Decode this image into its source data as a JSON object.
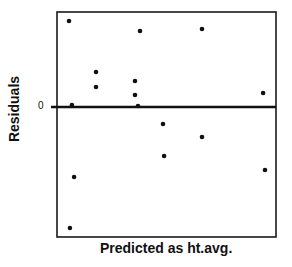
{
  "chart_data": {
    "type": "scatter",
    "title": "",
    "xlabel": "Predicted as ht.avg.",
    "ylabel": "Residuals",
    "y_tick_labels": [
      "0"
    ],
    "x_tick_labels": [],
    "xlim": [
      0,
      100
    ],
    "ylim": [
      -13,
      9.5
    ],
    "grid": false,
    "legend": null,
    "reference_line": {
      "y": 0,
      "style": "solid",
      "weight": "bold"
    },
    "points": [
      {
        "x": 5.5,
        "y": 8.6
      },
      {
        "x": 6.8,
        "y": 0.2
      },
      {
        "x": 7.8,
        "y": -7.0
      },
      {
        "x": 5.9,
        "y": -12.1
      },
      {
        "x": 17.8,
        "y": 3.5
      },
      {
        "x": 17.8,
        "y": 2.0
      },
      {
        "x": 37.9,
        "y": 7.6
      },
      {
        "x": 35.6,
        "y": 2.6
      },
      {
        "x": 35.6,
        "y": 1.2
      },
      {
        "x": 37.0,
        "y": 0.1
      },
      {
        "x": 48.4,
        "y": -1.7
      },
      {
        "x": 48.9,
        "y": -4.9
      },
      {
        "x": 66.2,
        "y": 7.8
      },
      {
        "x": 66.2,
        "y": -3.0
      },
      {
        "x": 94.1,
        "y": 1.4
      },
      {
        "x": 95.0,
        "y": -6.3
      }
    ]
  },
  "colors": {
    "frame": "#1a1a1a",
    "points": "#111111",
    "zero_line": "#111111",
    "background": "#ffffff"
  },
  "frame_px": {
    "left": 57,
    "top": 12,
    "right": 276,
    "bottom": 237,
    "zero_y": 107
  }
}
